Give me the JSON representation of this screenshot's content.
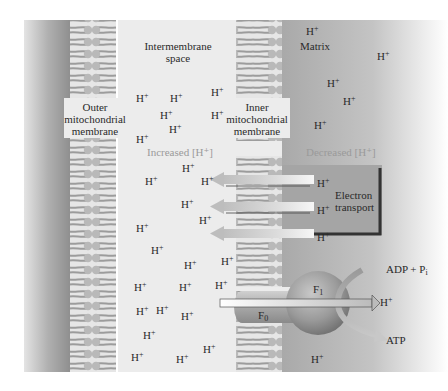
{
  "diagram": {
    "regions": {
      "intermembrane_space": "Intermembrane\nspace",
      "matrix": "Matrix",
      "outer_membrane": [
        "Outer",
        "mitochondrial",
        "membrane"
      ],
      "inner_membrane": [
        "Inner",
        "mitochondrial",
        "membrane"
      ]
    },
    "gradient_labels": {
      "increased": "Increased [H⁺]",
      "decreased": "Decreased [H⁺]"
    },
    "electron_transport": {
      "label_line1": "Electron",
      "label_line2": "transport",
      "proton_label": "H",
      "proton_sup": "+"
    },
    "atp_synthase": {
      "f1_label": "F",
      "f1_sub": "1",
      "f0_label": "F",
      "f0_sub": "0",
      "adp_label": "ADP + P",
      "adp_sub": "i",
      "atp_label": "ATP",
      "proton_out": "H",
      "proton_out_sup": "+"
    },
    "proton": {
      "symbol": "H",
      "charge": "+"
    },
    "colors": {
      "outer_wall_dark": "#8a8a8a",
      "outer_wall_light": "#c8c8c8",
      "lipid_head": "#b8b8b8",
      "lipid_tail": "#9c9c9c",
      "space_bg": "#ececec",
      "matrix_bg": "#b4b4b4",
      "et_box": "#a8a8a8",
      "et_border": "#333333",
      "arrow_fill": "#f4f4f4",
      "arrow_gray": "#bfbfbf",
      "sphere": "#8f8f8f",
      "text": "#2a2a2a",
      "faint_text": "#9a9a9a"
    }
  }
}
